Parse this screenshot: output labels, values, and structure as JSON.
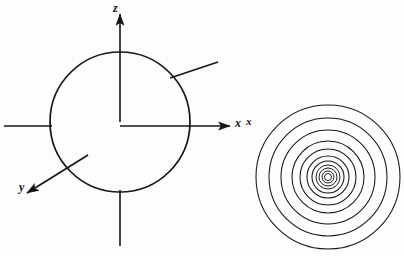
{
  "figure": {
    "background_color": "#fdfdfc",
    "ink_color": "#151515"
  },
  "sphere_diagram": {
    "name": "sphere-with-axes",
    "circle": {
      "cx": 120,
      "cy": 122,
      "r": 70
    },
    "axes": [
      {
        "id": "z",
        "label": "z",
        "label_x": 113,
        "label_y": 2,
        "direction": "up",
        "arrow": true,
        "from": [
          120,
          122
        ],
        "to": [
          120,
          14
        ]
      },
      {
        "id": "x",
        "label": "x",
        "label_x": 235,
        "label_y": 117,
        "direction": "right",
        "arrow": true,
        "from": [
          120,
          126
        ],
        "to": [
          230,
          126
        ]
      },
      {
        "id": "y",
        "label": "y",
        "label_x": 19,
        "label_y": 181,
        "direction": "lower-left",
        "arrow": true,
        "from": [
          88,
          155
        ],
        "to": [
          26,
          194
        ]
      }
    ],
    "rays": [
      {
        "id": "upper-right-ray",
        "arrow": false,
        "from": [
          172,
          77
        ],
        "to": [
          218,
          62
        ]
      },
      {
        "id": "left-ray",
        "arrow": false,
        "from": [
          50,
          126
        ],
        "to": [
          4,
          126
        ]
      },
      {
        "id": "bottom-ray",
        "arrow": false,
        "from": [
          120,
          192
        ],
        "to": [
          120,
          246
        ]
      }
    ]
  },
  "concentric_diagram": {
    "name": "concentric-circles",
    "label": "x",
    "label_x": 246,
    "label_y": 116,
    "center": [
      328,
      177
    ],
    "ring_count": 11,
    "radii": [
      72,
      59,
      47,
      36,
      28,
      21,
      16,
      12,
      9,
      6,
      3.5
    ]
  }
}
